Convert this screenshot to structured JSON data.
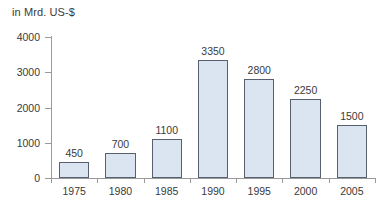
{
  "chart_data": {
    "type": "bar",
    "title": "",
    "ylabel": "in Mrd. US-$",
    "xlabel": "",
    "categories": [
      "1975",
      "1980",
      "1985",
      "1990",
      "1995",
      "2000",
      "2005"
    ],
    "values": [
      450,
      700,
      1100,
      3350,
      2800,
      2250,
      1500
    ],
    "value_labels": [
      "450",
      "700",
      "1100",
      "3350",
      "2800",
      "2250",
      "1500"
    ],
    "ylim": [
      0,
      4000
    ],
    "y_ticks": [
      0,
      1000,
      2000,
      3000,
      4000
    ],
    "y_tick_labels": [
      "0",
      "1000",
      "2000",
      "3000",
      "4000"
    ],
    "grid": false,
    "legend": null,
    "colors": {
      "bar_fill": "#dbe5f1",
      "bar_border": "#57606e",
      "axis": "#9a9a9a",
      "text": "#3a3a3a",
      "background": "#ffffff"
    }
  }
}
